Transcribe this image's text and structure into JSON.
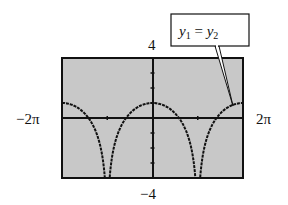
{
  "chart_data": {
    "type": "line",
    "title": "",
    "callout": {
      "y1": "y",
      "sub1": "1",
      "eq": " = ",
      "y2": "y",
      "sub2": "2"
    },
    "xlim": [
      -6.2832,
      6.2832
    ],
    "ylim": [
      -4,
      4
    ],
    "x_min_label": "−2π",
    "x_max_label": "2π",
    "y_max_label": "4",
    "y_min_label": "−4",
    "x_ticks": [
      -3.1416,
      3.1416
    ],
    "y_ticks": [
      -3,
      -2,
      -1,
      1,
      2,
      3
    ],
    "background": "#c8c8c8",
    "curve_color": "#111111",
    "series": [
      {
        "name": "y1 = y2",
        "function": "1 + 2 ln|cos(x/2)|"
      }
    ]
  }
}
